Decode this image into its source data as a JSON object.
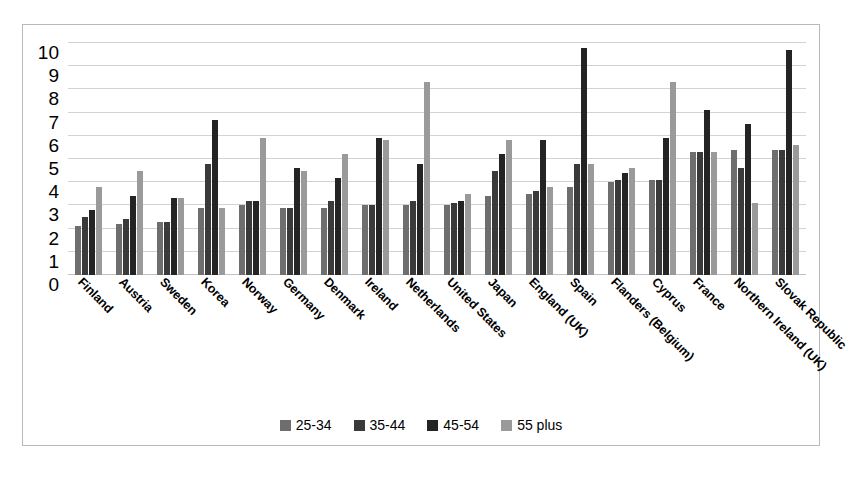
{
  "chart_data": {
    "type": "bar",
    "title": "",
    "subtitle": "",
    "xlabel": "",
    "ylabel": "",
    "ylim": [
      0,
      10
    ],
    "yticks": [
      0,
      1,
      2,
      3,
      4,
      5,
      6,
      7,
      8,
      9,
      10
    ],
    "grid": true,
    "legend_position": "bottom",
    "orientation": "vertical",
    "categories": [
      "Finland",
      "Austria",
      "Sweden",
      "Korea",
      "Norway",
      "Germany",
      "Denmark",
      "Ireland",
      "Netherlands",
      "United States",
      "Japan",
      "England (UK)",
      "Spain",
      "Flanders (Belgium)",
      "Cyprus",
      "France",
      "Northern Ireland (UK)",
      "Slovak Republic"
    ],
    "series": [
      {
        "name": "25-34",
        "color": "#6e6e6e",
        "values": [
          2.1,
          2.2,
          2.3,
          2.9,
          3.0,
          2.9,
          2.9,
          3.0,
          3.0,
          3.0,
          3.4,
          3.5,
          3.8,
          4.0,
          4.1,
          5.3,
          5.4,
          5.4
        ]
      },
      {
        "name": "35-44",
        "color": "#3a3a3a",
        "values": [
          2.5,
          2.4,
          2.3,
          4.8,
          3.2,
          2.9,
          3.2,
          3.0,
          3.2,
          3.1,
          4.5,
          3.6,
          4.8,
          4.1,
          4.1,
          5.3,
          4.6,
          5.4
        ]
      },
      {
        "name": "45-54",
        "color": "#242424",
        "values": [
          2.8,
          3.4,
          3.3,
          6.7,
          3.2,
          4.6,
          4.2,
          5.9,
          4.8,
          3.2,
          5.2,
          5.8,
          9.8,
          4.4,
          5.9,
          7.1,
          6.5,
          9.7
        ]
      },
      {
        "name": "55 plus",
        "color": "#9a9a9a",
        "values": [
          3.8,
          4.5,
          3.3,
          2.9,
          5.9,
          4.5,
          5.2,
          5.8,
          8.3,
          3.5,
          5.8,
          3.8,
          4.8,
          4.6,
          8.3,
          5.3,
          3.1,
          5.6
        ]
      }
    ]
  },
  "legend": {
    "items": [
      {
        "label": "25-34"
      },
      {
        "label": "35-44"
      },
      {
        "label": "45-54"
      },
      {
        "label": "55 plus"
      }
    ]
  },
  "colors": {
    "series_25_34": "#6e6e6e",
    "series_35_44": "#3a3a3a",
    "series_45_54": "#242424",
    "series_55_plus": "#9a9a9a",
    "gridline": "#d2d2d2",
    "frame_border": "#b9b9b9",
    "background": "#ffffff",
    "text": "#000000"
  }
}
